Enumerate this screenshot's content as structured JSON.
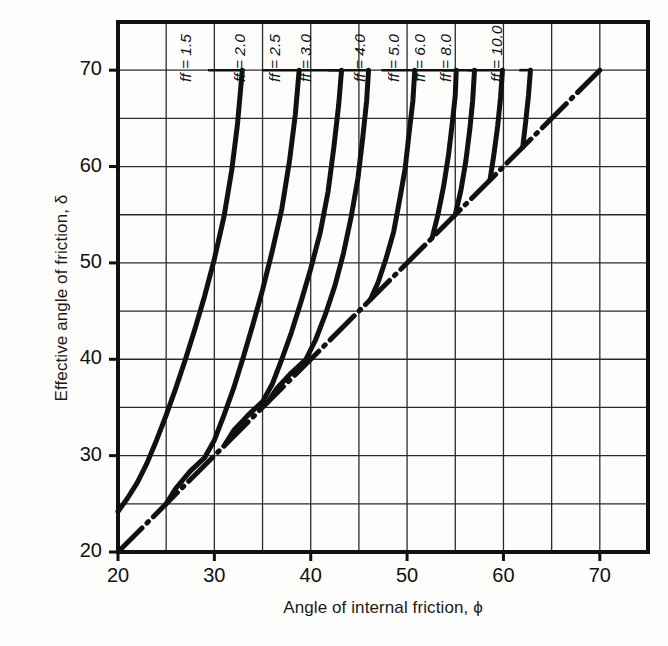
{
  "chart_data": {
    "type": "line",
    "title": "",
    "xlabel": "Angle of internal friction, ϕ",
    "ylabel": "Effective angle of friction, δ",
    "xlim": [
      20,
      75
    ],
    "ylim": [
      20,
      75
    ],
    "grid": true,
    "grid_step": 5,
    "xticks": [
      20,
      30,
      40,
      50,
      60,
      70
    ],
    "yticks": [
      20,
      30,
      40,
      50,
      60,
      70
    ],
    "xtick_labels": [
      "20",
      "30",
      "40",
      "50",
      "60",
      "70"
    ],
    "ytick_labels": [
      "20",
      "30",
      "40",
      "50",
      "60",
      "70"
    ],
    "legend_position": "inline-labels-at-top",
    "reference_line": {
      "name": "delta = phi",
      "style": "dash-dot",
      "points": [
        [
          20,
          20
        ],
        [
          70,
          70
        ]
      ]
    },
    "series": [
      {
        "name": "ff = 1.5",
        "label": "ff = 1.5",
        "ff": 1.5,
        "label_x": 28.0,
        "points": [
          [
            20,
            24.2
          ],
          [
            21,
            25.6
          ],
          [
            22,
            27.2
          ],
          [
            23,
            29.2
          ],
          [
            24,
            31.6
          ],
          [
            25,
            34.2
          ],
          [
            26,
            37.0
          ],
          [
            27,
            40.0
          ],
          [
            28,
            43.2
          ],
          [
            29,
            46.6
          ],
          [
            30,
            50.4
          ],
          [
            31,
            54.8
          ],
          [
            31.8,
            59.6
          ],
          [
            32.4,
            64.4
          ],
          [
            32.9,
            70.0
          ]
        ]
      },
      {
        "name": "ff = 2.0",
        "label": "ff = 2.0",
        "ff": 2.0,
        "label_x": 33.6,
        "points": [
          [
            25,
            25.0
          ],
          [
            26,
            26.6
          ],
          [
            27.5,
            28.4
          ],
          [
            29,
            29.8
          ],
          [
            30,
            31.6
          ],
          [
            31,
            34.2
          ],
          [
            32,
            37.0
          ],
          [
            33,
            40.2
          ],
          [
            34,
            43.6
          ],
          [
            35,
            47.2
          ],
          [
            36,
            51.2
          ],
          [
            37,
            55.6
          ],
          [
            37.8,
            60.6
          ],
          [
            38.4,
            65.4
          ],
          [
            38.8,
            70.0
          ]
        ]
      },
      {
        "name": "ff = 2.5",
        "label": "ff = 2.5",
        "ff": 2.5,
        "label_x": 37.2,
        "points": [
          [
            31,
            31.0
          ],
          [
            32,
            32.6
          ],
          [
            33.5,
            34.2
          ],
          [
            35,
            35.6
          ],
          [
            36,
            37.4
          ],
          [
            37,
            40.0
          ],
          [
            38,
            42.8
          ],
          [
            39,
            46.0
          ],
          [
            40,
            49.4
          ],
          [
            41,
            53.2
          ],
          [
            41.8,
            57.4
          ],
          [
            42.4,
            62.0
          ],
          [
            42.9,
            66.4
          ],
          [
            43.2,
            70.0
          ]
        ]
      },
      {
        "name": "ff = 3.0",
        "label": "ff = 3.0",
        "ff": 3.0,
        "label_x": 40.4,
        "points": [
          [
            35.5,
            35.5
          ],
          [
            36.5,
            37.0
          ],
          [
            38,
            38.6
          ],
          [
            39.5,
            40.0
          ],
          [
            40.5,
            42.0
          ],
          [
            41.5,
            44.6
          ],
          [
            42.5,
            47.6
          ],
          [
            43.4,
            51.0
          ],
          [
            44.2,
            54.8
          ],
          [
            44.9,
            58.8
          ],
          [
            45.4,
            63.0
          ],
          [
            45.8,
            66.8
          ],
          [
            46.0,
            70.0
          ]
        ]
      },
      {
        "name": "ff = 4.0",
        "label": "ff = 4.0",
        "ff": 4.0,
        "label_x": 46.0,
        "points": [
          [
            46.2,
            46.2
          ],
          [
            47.0,
            48.0
          ],
          [
            47.8,
            50.4
          ],
          [
            48.6,
            53.2
          ],
          [
            49.2,
            56.4
          ],
          [
            49.8,
            59.8
          ],
          [
            50.2,
            63.4
          ],
          [
            50.6,
            66.8
          ],
          [
            50.8,
            70.0
          ]
        ]
      },
      {
        "name": "ff = 5.0",
        "label": "ff = 5.0",
        "ff": 5.0,
        "label_x": 49.6,
        "points": [
          [
            52.6,
            52.6
          ],
          [
            53.2,
            55.0
          ],
          [
            53.8,
            58.0
          ],
          [
            54.3,
            61.2
          ],
          [
            54.7,
            64.6
          ],
          [
            55.0,
            67.4
          ],
          [
            55.1,
            70.0
          ]
        ]
      },
      {
        "name": "ff = 6.0",
        "label": "ff = 6.0",
        "ff": 6.0,
        "label_x": 52.3,
        "points": [
          [
            55.0,
            55.0
          ],
          [
            55.6,
            57.6
          ],
          [
            56.1,
            60.6
          ],
          [
            56.5,
            63.8
          ],
          [
            56.8,
            66.8
          ],
          [
            57.0,
            70.0
          ]
        ]
      },
      {
        "name": "ff = 8.0",
        "label": "ff = 8.0",
        "ff": 8.0,
        "label_x": 55.0,
        "points": [
          [
            58.6,
            58.6
          ],
          [
            59.0,
            61.2
          ],
          [
            59.4,
            64.2
          ],
          [
            59.7,
            67.2
          ],
          [
            59.9,
            70.0
          ]
        ]
      },
      {
        "name": "ff = 10.0",
        "label": "ff = 10.0",
        "ff": 10.0,
        "label_x": 60.3,
        "points": [
          [
            62.0,
            62.0
          ],
          [
            62.3,
            64.6
          ],
          [
            62.6,
            67.4
          ],
          [
            62.8,
            70.0
          ]
        ]
      }
    ],
    "leader_line_y": 70
  }
}
